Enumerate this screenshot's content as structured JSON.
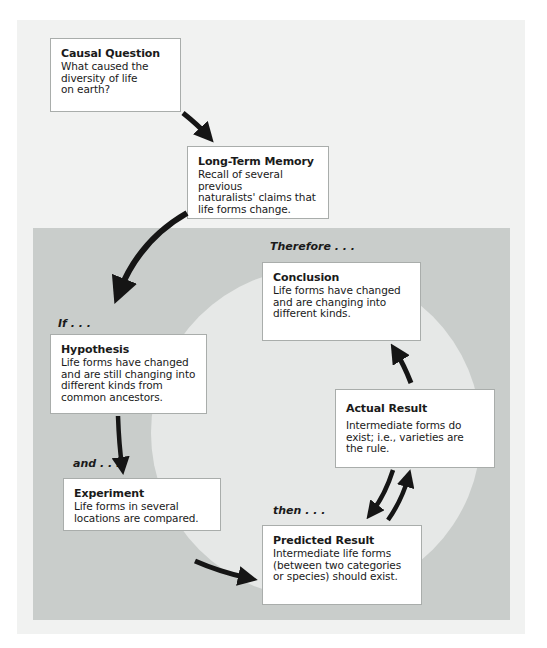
{
  "diagram": {
    "type": "scientific-method-cycle",
    "colors": {
      "page_background": "#ffffff",
      "outer_panel": "#f1f2f1",
      "inner_panel": "#c9cdcb",
      "inner_circle": "#e6e8e7",
      "box_fill": "#ffffff",
      "box_border": "#a9adab",
      "arrow": "#151515",
      "text": "#1a1a1a"
    },
    "connectors": {
      "if": "If . . .",
      "and": "and . . .",
      "then": "then . . .",
      "therefore": "Therefore . . ."
    },
    "boxes": {
      "causal_question": {
        "title": "Causal Question",
        "lines": [
          "What caused the",
          "diversity of life",
          "on earth?"
        ]
      },
      "long_term_memory": {
        "title": "Long-Term Memory",
        "lines": [
          "Recall of several previous",
          "naturalists' claims that",
          "life forms change."
        ]
      },
      "hypothesis": {
        "title": "Hypothesis",
        "lines": [
          "Life forms have changed",
          "and are still changing into",
          "different kinds from",
          "common ancestors."
        ]
      },
      "experiment": {
        "title": "Experiment",
        "lines": [
          "Life forms in several",
          "locations are compared."
        ]
      },
      "predicted_result": {
        "title": "Predicted Result",
        "lines": [
          "Intermediate life forms",
          "(between two categories",
          "or species) should exist."
        ]
      },
      "actual_result": {
        "title": "Actual Result",
        "lines": [
          "Intermediate forms do",
          "exist; i.e., varieties are",
          "the rule."
        ]
      },
      "conclusion": {
        "title": "Conclusion",
        "lines": [
          "Life forms have changed",
          "and are changing into",
          "different kinds."
        ]
      }
    },
    "flow": [
      {
        "from": "causal_question",
        "to": "long_term_memory"
      },
      {
        "from": "long_term_memory",
        "to": "hypothesis",
        "label": "If . . ."
      },
      {
        "from": "hypothesis",
        "to": "experiment",
        "label": "and . . ."
      },
      {
        "from": "experiment",
        "to": "predicted_result",
        "label": "then . . ."
      },
      {
        "from": "predicted_result",
        "to": "actual_result"
      },
      {
        "from": "actual_result",
        "to": "predicted_result"
      },
      {
        "from": "actual_result",
        "to": "conclusion",
        "label": "Therefore . . ."
      }
    ]
  }
}
